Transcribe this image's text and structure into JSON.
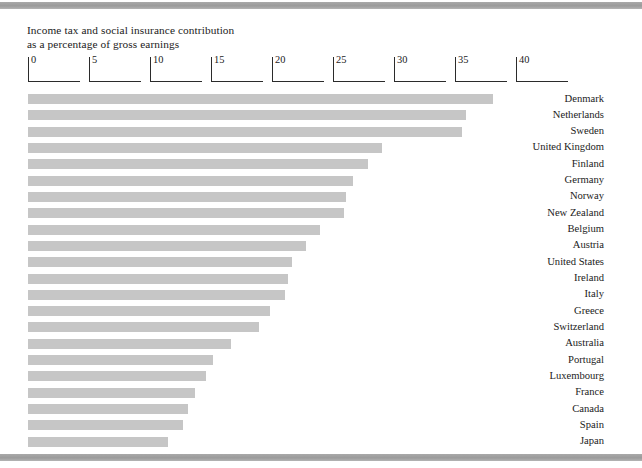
{
  "page": {
    "background_color": "#ffffff",
    "band_color": "#9b9b9b",
    "bar_color": "#c6c6c6",
    "text_color": "#1b1b1b"
  },
  "title_line1": "Income tax and social insurance contribution",
  "title_line2": "as a percentage of gross earnings",
  "title": "Income tax and social insurance contribution\nas a percentage of gross earnings",
  "axis": {
    "ticks": [
      "0",
      "5",
      "10",
      "15",
      "20",
      "25",
      "30",
      "35",
      "40"
    ]
  },
  "chart_data": {
    "type": "bar",
    "orientation": "horizontal",
    "title": "Income tax and social insurance contribution as a percentage of gross earnings",
    "xlabel": "",
    "ylabel": "",
    "xlim": [
      0,
      40
    ],
    "xticks": [
      0,
      5,
      10,
      15,
      20,
      25,
      30,
      35,
      40
    ],
    "grid": false,
    "legend": "none",
    "bar_color": "#c6c6c6",
    "categories": [
      "Denmark",
      "Netherlands",
      "Sweden",
      "United Kingdom",
      "Finland",
      "Germany",
      "Norway",
      "New Zealand",
      "Belgium",
      "Austria",
      "United States",
      "Ireland",
      "Italy",
      "Greece",
      "Switzerland",
      "Australia",
      "Portugal",
      "Luxembourg",
      "France",
      "Canada",
      "Spain",
      "Japan"
    ],
    "values": [
      38.1,
      35.9,
      35.6,
      29.0,
      27.9,
      26.6,
      26.1,
      25.9,
      23.9,
      22.8,
      21.6,
      21.3,
      21.1,
      19.8,
      18.9,
      16.6,
      15.2,
      14.6,
      13.7,
      13.1,
      12.7,
      11.5
    ]
  }
}
